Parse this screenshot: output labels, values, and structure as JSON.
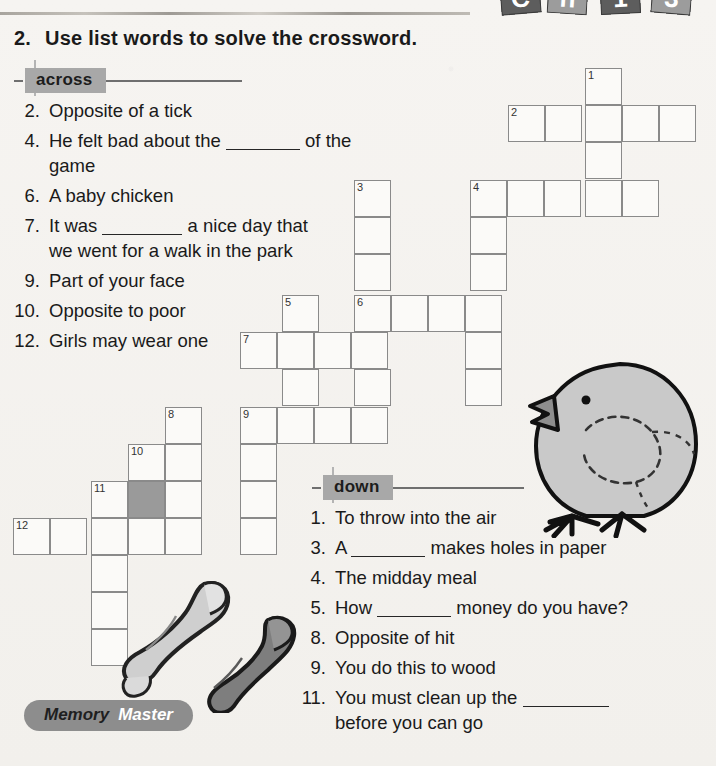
{
  "header": {
    "question_number": "2.",
    "instruction": "Use list words to solve the crossword.",
    "corner_tiles": [
      "C",
      "h",
      "1",
      "3"
    ]
  },
  "across": {
    "label": "across",
    "clues": [
      {
        "num": "2.",
        "text": "Opposite of a tick"
      },
      {
        "num": "4.",
        "text": "He felt bad about the ______ of the game",
        "pre": "He felt bad about the",
        "post": "of the game"
      },
      {
        "num": "6.",
        "text": "A baby chicken"
      },
      {
        "num": "7.",
        "text": "It was ______ a nice day that we went for a walk in the park",
        "pre": "It was",
        "post": "a nice day that",
        "line2": "we went for a walk in the park"
      },
      {
        "num": "9.",
        "text": "Part of your face"
      },
      {
        "num": "10.",
        "text": "Opposite to poor"
      },
      {
        "num": "12.",
        "text": "Girls may wear one"
      }
    ]
  },
  "down": {
    "label": "down",
    "clues": [
      {
        "num": "1.",
        "text": "To throw into the air"
      },
      {
        "num": "3.",
        "text": "A ______ makes holes in paper",
        "pre": "A",
        "post": "makes holes in paper"
      },
      {
        "num": "4.",
        "text": "The midday meal"
      },
      {
        "num": "5.",
        "text": "How ______ money do you have?",
        "pre": "How",
        "post": "money do you have?"
      },
      {
        "num": "8.",
        "text": "Opposite of hit"
      },
      {
        "num": "9.",
        "text": "You do this to wood"
      },
      {
        "num": "11.",
        "text": "You must clean up the ______ before you can go",
        "pre": "You must clean up the",
        "post": "",
        "line2": "before you can go"
      }
    ]
  },
  "grid": {
    "cell_size": 37,
    "shaded_color": "#9a9a9a",
    "cells": [
      {
        "x": 585,
        "y": 68,
        "num": "1"
      },
      {
        "x": 585,
        "y": 105,
        "num": ""
      },
      {
        "x": 508,
        "y": 105,
        "num": "2"
      },
      {
        "x": 545,
        "y": 105,
        "num": ""
      },
      {
        "x": 622,
        "y": 105,
        "num": ""
      },
      {
        "x": 659,
        "y": 105,
        "num": ""
      },
      {
        "x": 585,
        "y": 142,
        "num": ""
      },
      {
        "x": 354,
        "y": 180,
        "num": "3"
      },
      {
        "x": 354,
        "y": 217,
        "num": ""
      },
      {
        "x": 354,
        "y": 254,
        "num": ""
      },
      {
        "x": 470,
        "y": 180,
        "num": "4"
      },
      {
        "x": 507,
        "y": 180,
        "num": ""
      },
      {
        "x": 544,
        "y": 180,
        "num": ""
      },
      {
        "x": 585,
        "y": 180,
        "num": ""
      },
      {
        "x": 622,
        "y": 180,
        "num": ""
      },
      {
        "x": 470,
        "y": 217,
        "num": ""
      },
      {
        "x": 470,
        "y": 254,
        "num": ""
      },
      {
        "x": 282,
        "y": 295,
        "num": "5"
      },
      {
        "x": 354,
        "y": 295,
        "num": "6"
      },
      {
        "x": 391,
        "y": 295,
        "num": ""
      },
      {
        "x": 428,
        "y": 295,
        "num": ""
      },
      {
        "x": 465,
        "y": 295,
        "num": ""
      },
      {
        "x": 240,
        "y": 332,
        "num": "7"
      },
      {
        "x": 277,
        "y": 332,
        "num": ""
      },
      {
        "x": 314,
        "y": 332,
        "num": ""
      },
      {
        "x": 351,
        "y": 332,
        "num": ""
      },
      {
        "x": 465,
        "y": 332,
        "num": ""
      },
      {
        "x": 282,
        "y": 369,
        "num": ""
      },
      {
        "x": 354,
        "y": 369,
        "num": ""
      },
      {
        "x": 465,
        "y": 369,
        "num": ""
      },
      {
        "x": 165,
        "y": 407,
        "num": "8"
      },
      {
        "x": 240,
        "y": 407,
        "num": "9"
      },
      {
        "x": 277,
        "y": 407,
        "num": ""
      },
      {
        "x": 314,
        "y": 407,
        "num": ""
      },
      {
        "x": 351,
        "y": 407,
        "num": ""
      },
      {
        "x": 128,
        "y": 444,
        "num": "10"
      },
      {
        "x": 165,
        "y": 444,
        "num": ""
      },
      {
        "x": 240,
        "y": 444,
        "num": ""
      },
      {
        "x": 91,
        "y": 481,
        "num": "11"
      },
      {
        "x": 128,
        "y": 481,
        "num": "",
        "shaded": true
      },
      {
        "x": 165,
        "y": 481,
        "num": ""
      },
      {
        "x": 240,
        "y": 481,
        "num": ""
      },
      {
        "x": 13,
        "y": 518,
        "num": "12"
      },
      {
        "x": 50,
        "y": 518,
        "num": ""
      },
      {
        "x": 91,
        "y": 518,
        "num": ""
      },
      {
        "x": 128,
        "y": 518,
        "num": ""
      },
      {
        "x": 165,
        "y": 518,
        "num": ""
      },
      {
        "x": 240,
        "y": 518,
        "num": ""
      },
      {
        "x": 91,
        "y": 555,
        "num": ""
      },
      {
        "x": 91,
        "y": 592,
        "num": ""
      },
      {
        "x": 91,
        "y": 629,
        "num": ""
      }
    ]
  },
  "badge": {
    "word1": "Memory",
    "word2": "Master"
  },
  "art": {
    "chick_label": "baby-chick-illustration",
    "socks_label": "pair-of-socks-illustration"
  }
}
